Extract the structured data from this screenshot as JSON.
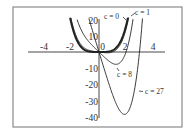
{
  "chart_data": {
    "type": "line",
    "title": "",
    "xlabel": "",
    "ylabel": "",
    "function": "f(x) = x^4 - c*x",
    "xlim": [
      -4.5,
      4.9
    ],
    "ylim": [
      -40,
      21
    ],
    "grid": false,
    "legend": "inline annotations",
    "x_ticks": [
      {
        "value": -4,
        "label": "-4"
      },
      {
        "value": -2,
        "label": "-2"
      },
      {
        "value": 0,
        "label": "0"
      },
      {
        "value": 2,
        "label": "2"
      },
      {
        "value": 4,
        "label": "4"
      }
    ],
    "y_ticks": [
      {
        "value": 20,
        "label": "20"
      },
      {
        "value": 10,
        "label": "10"
      },
      {
        "value": -10,
        "label": "-10"
      },
      {
        "value": -20,
        "label": "-20"
      },
      {
        "value": -30,
        "label": "-30"
      },
      {
        "value": -40,
        "label": "-40"
      }
    ],
    "series": [
      {
        "name": "c = 0",
        "c": 0,
        "bold": true,
        "x_range": [
          -2.14,
          2.14
        ],
        "minimum": {
          "x": 0,
          "y": 0
        }
      },
      {
        "name": "c = 1",
        "c": 1,
        "bold": false,
        "x_range": [
          -2.08,
          2.2
        ],
        "minimum": {
          "x": 0.63,
          "y": -0.47
        }
      },
      {
        "name": "c = 8",
        "c": 8,
        "bold": false,
        "x_range": [
          -1.62,
          2.52
        ],
        "minimum": {
          "x": 1.26,
          "y": -7.56
        }
      },
      {
        "name": "c = 27",
        "c": 27,
        "bold": false,
        "x_range": [
          -0.75,
          3.22
        ],
        "minimum": {
          "x": 1.89,
          "y": -38.3
        }
      }
    ],
    "annotations": [
      {
        "text": "c = 0",
        "series": "c = 0"
      },
      {
        "text": "c = 1",
        "series": "c = 1"
      },
      {
        "text": "c = 8",
        "series": "c = 8"
      },
      {
        "text": "c = 27",
        "series": "c = 27"
      }
    ]
  }
}
